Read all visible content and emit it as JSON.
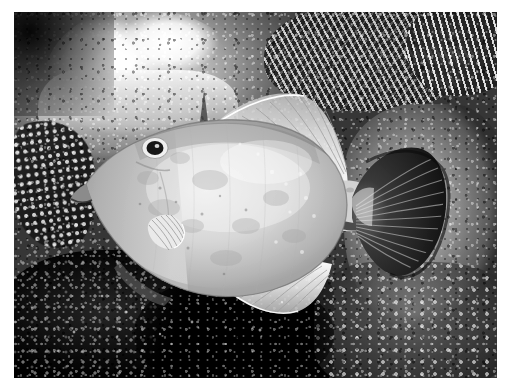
{
  "document": {
    "kind": "photograph",
    "medium": "underwater photograph",
    "rendering": "black-and-white / grayscale halftone print",
    "page_background": "#ffffff"
  },
  "photo": {
    "frame": {
      "x": 14,
      "y": 12,
      "width": 483,
      "height": 366,
      "border_color": "#ffffff"
    },
    "scene": {
      "subject": "whitespotted filefish",
      "setting": "coral reef seafloor",
      "orientation": "fish facing left, viewed from the side",
      "lighting": "strobe-lit from upper left, dark background at bottom"
    },
    "subject": {
      "name": "filefish",
      "body": {
        "label": "fish-body",
        "tone": "pale light gray, mottled with faint darker blotches",
        "body_fill": "#c9c9c9",
        "shadow_fill": "#8e8e8e",
        "highlight_fill": "#e3e3e3"
      },
      "parts": [
        {
          "name": "eye",
          "label": "Eye",
          "tone": "dark pupil with pale ring",
          "x": 155,
          "y": 148
        },
        {
          "name": "snout",
          "label": "Snout",
          "tone": "mid gray",
          "x": 100,
          "y": 172
        },
        {
          "name": "pectoral-fin",
          "label": "Pectoral fin",
          "tone": "translucent pale with fine rays",
          "x": 157,
          "y": 208
        },
        {
          "name": "dorsal-fin",
          "label": "Dorsal fin",
          "tone": "translucent white, ray-striped",
          "x": 285,
          "y": 125
        },
        {
          "name": "anal-fin",
          "label": "Anal fin",
          "tone": "translucent white, ray-striped",
          "x": 252,
          "y": 268
        },
        {
          "name": "caudal-peduncle",
          "label": "Caudal peduncle",
          "tone": "pale with dark blotch",
          "x": 330,
          "y": 200
        },
        {
          "name": "caudal-fin",
          "label": "Tail fin",
          "tone": "dark charcoal fan with radiating rays",
          "x": 370,
          "y": 195
        },
        {
          "name": "dorsal-spine",
          "label": "Dorsal spine",
          "tone": "thin dark spine above head",
          "x": 268,
          "y": 95
        }
      ]
    },
    "background_elements": [
      {
        "name": "branching-coral",
        "label": "Branching coral",
        "tone": "pale branches over dark shadow",
        "region": "top right"
      },
      {
        "name": "coral-rubble",
        "label": "Coral rubble",
        "tone": "bright white limestone",
        "region": "top left"
      },
      {
        "name": "encrusting-sponge",
        "label": "Encrusting sponge",
        "tone": "dark knobby texture",
        "region": "left edge"
      },
      {
        "name": "coral-rock",
        "label": "Coral rock",
        "tone": "medium gray, rough pitted surface",
        "region": "right"
      },
      {
        "name": "reef-shadow",
        "label": "Reef shadow",
        "tone": "near black",
        "region": "bottom"
      }
    ],
    "palette": {
      "white": "#ffffff",
      "light_gray": "#dcdcdc",
      "body_gray": "#c6c6c6",
      "mid_gray": "#8b8b8b",
      "dark_gray": "#4a4a4a",
      "near_black": "#0d0d0d",
      "tail_dark": "#2b2b2b"
    }
  }
}
